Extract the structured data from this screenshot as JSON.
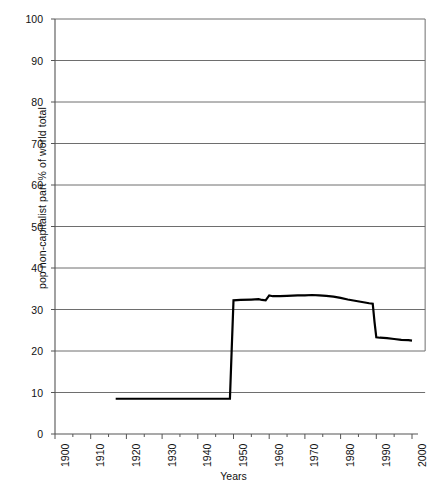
{
  "chart_data": {
    "type": "line",
    "title": "",
    "xlabel": "Years",
    "ylabel": "pop non-capitalist part  % of world total",
    "xlim": [
      1900,
      2002
    ],
    "ylim": [
      0,
      100
    ],
    "grid": true,
    "grid_axis": "y",
    "legend": "none",
    "x_tick_labels": [
      "1900",
      "1910",
      "1920",
      "1930",
      "1940",
      "1950",
      "1960",
      "1970",
      "1980",
      "1990",
      "2000"
    ],
    "x_tick_values": [
      1900,
      1910,
      1920,
      1930,
      1940,
      1950,
      1960,
      1970,
      1980,
      1990,
      2000
    ],
    "y_tick_labels": [
      "0",
      "10",
      "20",
      "30",
      "40",
      "50",
      "60",
      "70",
      "80",
      "90",
      "100"
    ],
    "y_tick_values": [
      0,
      10,
      20,
      30,
      40,
      50,
      60,
      70,
      80,
      90,
      100
    ],
    "minor_x_ticks": [
      1905,
      1915,
      1925,
      1935,
      1945,
      1955,
      1965,
      1975,
      1985,
      1995
    ],
    "series": [
      {
        "name": "pop non-capitalist part % of world total",
        "color": "#000000",
        "line_width": 2.2,
        "x": [
          1917,
          1920,
          1925,
          1930,
          1935,
          1940,
          1945,
          1948,
          1949,
          1949.5,
          1950,
          1952,
          1955,
          1957,
          1958,
          1959,
          1960,
          1961,
          1963,
          1965,
          1968,
          1970,
          1972,
          1974,
          1976,
          1978,
          1980,
          1982,
          1984,
          1986,
          1988,
          1989,
          1989.5,
          1990,
          1991,
          1993,
          1995,
          1997,
          1999,
          2000
        ],
        "y": [
          8.5,
          8.5,
          8.5,
          8.5,
          8.5,
          8.5,
          8.5,
          8.5,
          8.5,
          20.5,
          32.2,
          32.3,
          32.4,
          32.5,
          32.3,
          32.2,
          33.4,
          33.2,
          33.2,
          33.3,
          33.4,
          33.4,
          33.5,
          33.4,
          33.3,
          33.1,
          32.8,
          32.4,
          32.1,
          31.8,
          31.5,
          31.4,
          27.0,
          23.3,
          23.2,
          23.1,
          22.9,
          22.7,
          22.6,
          22.5
        ]
      }
    ]
  },
  "axes": {
    "y_axis_title": "pop non-capitalist part  % of world total",
    "x_axis_title": "Years"
  }
}
